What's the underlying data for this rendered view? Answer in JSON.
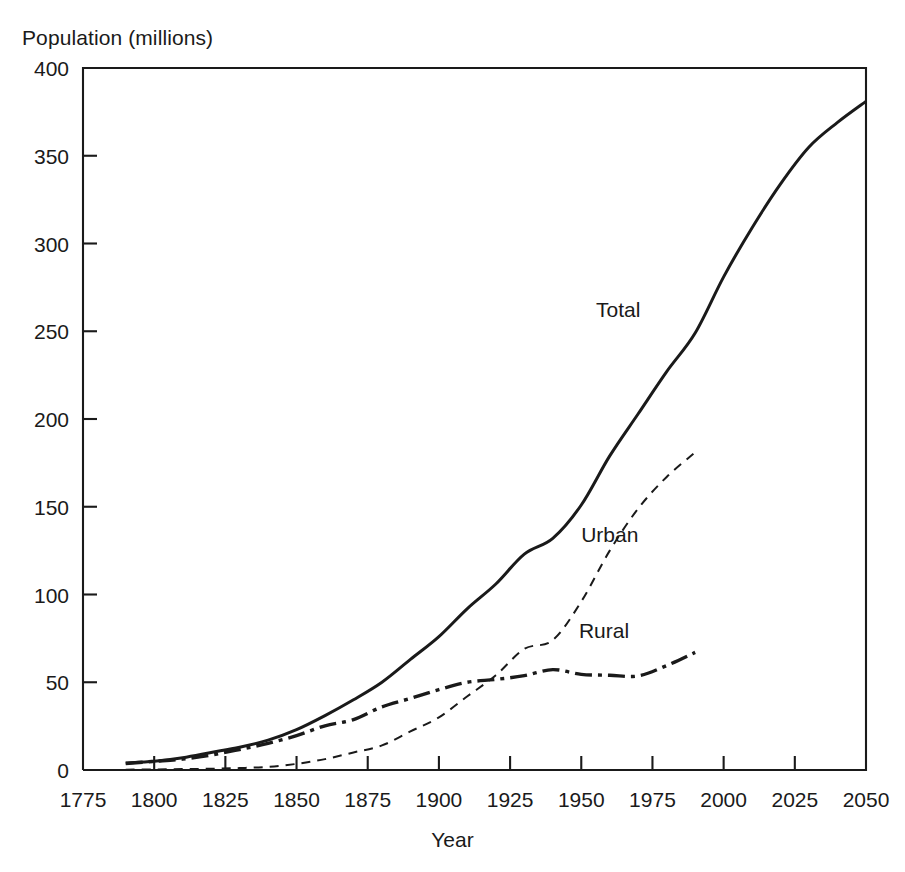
{
  "chart_data": {
    "type": "line",
    "title": "",
    "xlabel": "Year",
    "ylabel": "Population (millions)",
    "xlim": [
      1775,
      2050
    ],
    "ylim": [
      0,
      400
    ],
    "xticks": [
      1775,
      1800,
      1825,
      1850,
      1875,
      1900,
      1925,
      1950,
      1975,
      2000,
      2025,
      2050
    ],
    "yticks": [
      0,
      50,
      100,
      150,
      200,
      250,
      300,
      350,
      400
    ],
    "grid": false,
    "legend_position": "inline-labels",
    "annotations": [
      {
        "text": "Total",
        "x": 1963,
        "y": 258
      },
      {
        "text": "Urban",
        "x": 1960,
        "y": 130
      },
      {
        "text": "Rural",
        "x": 1958,
        "y": 75
      }
    ],
    "series": [
      {
        "name": "Total",
        "style": "solid",
        "x": [
          1790,
          1800,
          1810,
          1820,
          1830,
          1840,
          1850,
          1860,
          1870,
          1880,
          1890,
          1900,
          1910,
          1920,
          1930,
          1940,
          1950,
          1960,
          1970,
          1980,
          1990,
          2000,
          2010,
          2020,
          2030,
          2040,
          2050
        ],
        "values": [
          4,
          5,
          7,
          10,
          13,
          17,
          23,
          31,
          40,
          50,
          63,
          76,
          92,
          106,
          123,
          132,
          151,
          179,
          203,
          227,
          249,
          281,
          309,
          334,
          355,
          369,
          381
        ]
      },
      {
        "name": "Urban",
        "style": "dashed",
        "x": [
          1790,
          1800,
          1810,
          1820,
          1830,
          1840,
          1850,
          1860,
          1870,
          1880,
          1890,
          1900,
          1910,
          1920,
          1930,
          1940,
          1950,
          1960,
          1970,
          1980,
          1990
        ],
        "values": [
          0.2,
          0.3,
          0.5,
          0.7,
          1.1,
          1.8,
          3.5,
          6.2,
          10,
          14,
          22,
          30,
          42,
          54,
          69,
          74,
          96,
          125,
          149,
          167,
          181
        ]
      },
      {
        "name": "Rural",
        "style": "dash-dot",
        "x": [
          1790,
          1800,
          1810,
          1820,
          1830,
          1840,
          1850,
          1860,
          1870,
          1880,
          1890,
          1900,
          1910,
          1920,
          1930,
          1940,
          1950,
          1960,
          1970,
          1980,
          1990
        ],
        "values": [
          3.7,
          4.9,
          6.2,
          8.5,
          11.7,
          15.2,
          19.6,
          25.2,
          28.7,
          36,
          40.8,
          45.8,
          50,
          51.6,
          53.8,
          57.2,
          54.5,
          54,
          53.6,
          59.5,
          67
        ]
      }
    ]
  },
  "axis": {
    "x_tick_labels": [
      "1775",
      "1800",
      "1825",
      "1850",
      "1875",
      "1900",
      "1925",
      "1950",
      "1975",
      "2000",
      "2025",
      "2050"
    ],
    "y_tick_labels": [
      "400",
      "350",
      "300",
      "250",
      "200",
      "150",
      "100",
      "50",
      "0"
    ],
    "x_title": "Year",
    "y_title": "Population (millions)"
  },
  "labels": {
    "total": "Total",
    "urban": "Urban",
    "rural": "Rural"
  },
  "colors": {
    "ink": "#1a1a1a",
    "background": "#ffffff"
  }
}
